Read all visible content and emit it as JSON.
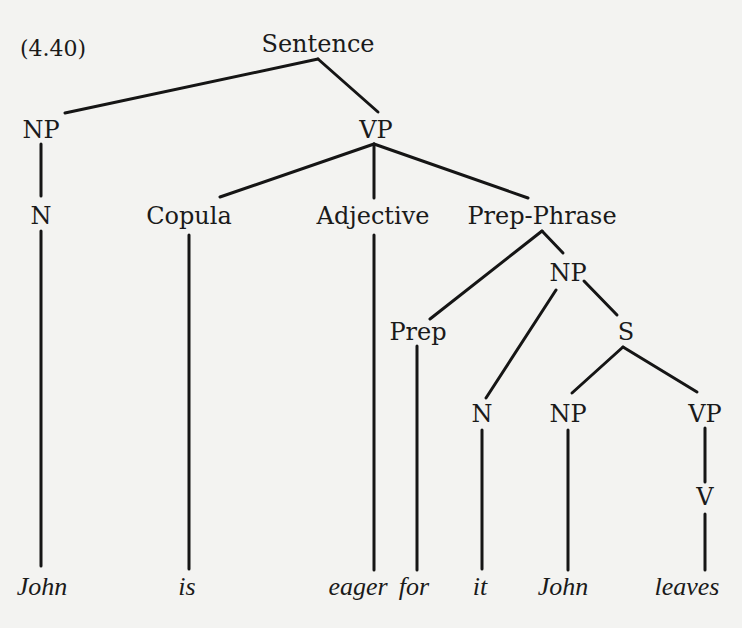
{
  "example_number": "(4.40)",
  "colors": {
    "background": "#f3f3f1",
    "ink": "#1a1a1a"
  },
  "tree": {
    "root": "Sentence",
    "nodes": {
      "sentence": "Sentence",
      "np_subject": "NP",
      "vp_main": "VP",
      "n_subject": "N",
      "copula": "Copula",
      "adjective": "Adjective",
      "prep_phrase": "Prep-Phrase",
      "np_object": "NP",
      "prep": "Prep",
      "s_embedded": "S",
      "n_object": "N",
      "np_embedded": "NP",
      "vp_embedded": "VP",
      "v_embedded": "V"
    },
    "words": [
      "John",
      "is",
      "eager",
      "for",
      "it",
      "John",
      "leaves"
    ]
  }
}
